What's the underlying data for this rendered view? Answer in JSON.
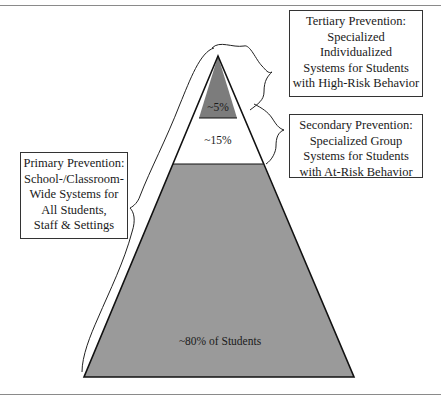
{
  "diagram": {
    "type": "pyramid",
    "tiers": [
      {
        "name": "tertiary",
        "percent_label": "~5%",
        "fill": "#7a7a7a"
      },
      {
        "name": "secondary",
        "percent_label": "~15%",
        "fill": "#ffffff"
      },
      {
        "name": "primary",
        "percent_label": "~80% of Students",
        "fill": "#999999"
      }
    ],
    "labels": {
      "tertiary": [
        "Tertiary Prevention:",
        "Specialized",
        "Individualized",
        "Systems for Students",
        "with High-Risk Behavior"
      ],
      "secondary": [
        "Secondary Prevention:",
        "Specialized Group",
        "Systems for Students",
        "with At-Risk Behavior"
      ],
      "primary": [
        "Primary Prevention:",
        "School-/Classroom-",
        "Wide Systems for",
        "All Students,",
        "Staff & Settings"
      ]
    },
    "colors": {
      "outline": "#111111",
      "box_border": "#333333",
      "rule": "#8a8a8a"
    }
  }
}
